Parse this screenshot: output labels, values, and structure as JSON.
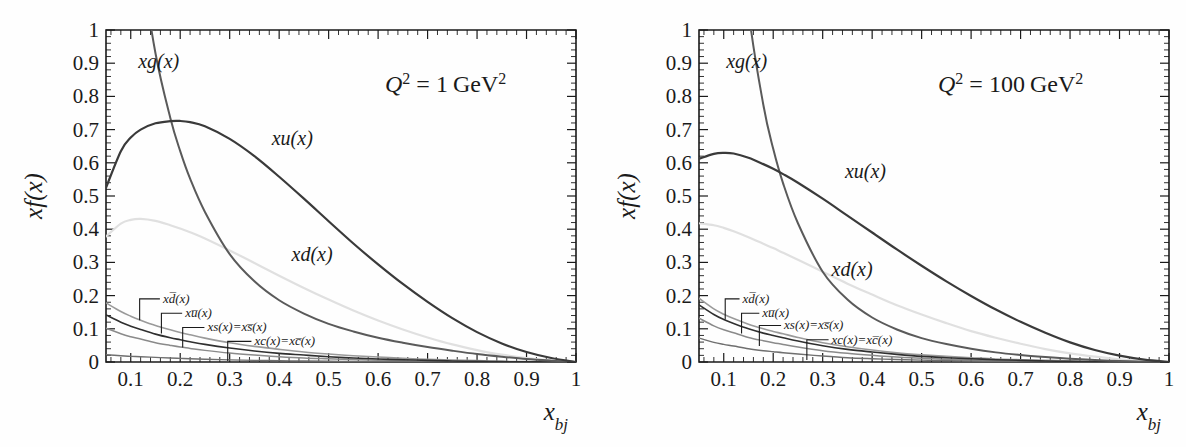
{
  "figure": {
    "type": "two-panel-line-plot",
    "background": "#ffffff"
  },
  "chart_data": [
    {
      "type": "line",
      "panel": "left",
      "title": "",
      "annotation": "Q² = 1 GeV²",
      "annotation_parts": {
        "q": "Q",
        "qexp": "2",
        "eq": "=",
        "value": "1",
        "unit": "GeV",
        "unitexp": "2"
      },
      "xlabel": "x_bj",
      "xlabel_parts": {
        "base": "x",
        "sub": "bj"
      },
      "ylabel": "xf(x)",
      "xlim": [
        0.05,
        1.0
      ],
      "ylim": [
        0.0,
        1.0
      ],
      "xticks": [
        0.1,
        0.2,
        0.3,
        0.4,
        0.5,
        0.6,
        0.7,
        0.8,
        0.9,
        1.0
      ],
      "xticklabels": [
        "0.1",
        "0.2",
        "0.3",
        "0.4",
        "0.5",
        "0.6",
        "0.7",
        "0.8",
        "0.9",
        "1"
      ],
      "yticks": [
        0,
        0.1,
        0.2,
        0.3,
        0.4,
        0.5,
        0.6,
        0.7,
        0.8,
        0.9,
        1.0
      ],
      "yticklabels": [
        "0",
        "0.1",
        "0.2",
        "0.3",
        "0.4",
        "0.5",
        "0.6",
        "0.7",
        "0.8",
        "0.9",
        "1"
      ],
      "grid": false,
      "legend": "inline-curve-labels",
      "x": [
        0.05,
        0.08,
        0.1,
        0.12,
        0.15,
        0.18,
        0.2,
        0.22,
        0.25,
        0.3,
        0.35,
        0.4,
        0.45,
        0.5,
        0.55,
        0.6,
        0.65,
        0.7,
        0.75,
        0.8,
        0.85,
        0.9,
        0.95,
        1.0
      ],
      "series": [
        {
          "name": "xg(x)",
          "label": "xg(x)",
          "color": "#5a5a5a",
          "width": 2.0,
          "values": [
            2.55,
            1.83,
            1.48,
            1.22,
            0.93,
            0.735,
            0.635,
            0.552,
            0.452,
            0.325,
            0.243,
            0.186,
            0.146,
            0.115,
            0.092,
            0.073,
            0.058,
            0.045,
            0.034,
            0.024,
            0.016,
            0.009,
            0.004,
            0.0
          ]
        },
        {
          "name": "xu(x)",
          "label": "xu(x)",
          "color": "#3a3a3a",
          "width": 2.2,
          "values": [
            0.525,
            0.635,
            0.676,
            0.7,
            0.719,
            0.7255,
            0.726,
            0.7225,
            0.71,
            0.672,
            0.62,
            0.558,
            0.492,
            0.424,
            0.357,
            0.294,
            0.235,
            0.181,
            0.132,
            0.09,
            0.056,
            0.03,
            0.012,
            0.0
          ]
        },
        {
          "name": "xd(x)",
          "label": "xd(x)",
          "color": "#e0e0e0",
          "width": 2.2,
          "values": [
            0.378,
            0.417,
            0.428,
            0.431,
            0.425,
            0.412,
            0.402,
            0.391,
            0.372,
            0.336,
            0.298,
            0.26,
            0.223,
            0.188,
            0.155,
            0.125,
            0.098,
            0.074,
            0.053,
            0.036,
            0.022,
            0.012,
            0.005,
            0.0
          ]
        },
        {
          "name": "xdbar(x)",
          "label": "xd̅(x)",
          "color": "#9a9a9a",
          "width": 1.6,
          "values": [
            0.178,
            0.152,
            0.138,
            0.126,
            0.11,
            0.097,
            0.089,
            0.082,
            0.072,
            0.058,
            0.047,
            0.038,
            0.03,
            0.024,
            0.019,
            0.015,
            0.011,
            0.008,
            0.006,
            0.004,
            0.002,
            0.001,
            0.0005,
            0.0
          ]
        },
        {
          "name": "xubar(x)",
          "label": "xu̅(x)",
          "color": "#2f2f2f",
          "width": 1.6,
          "values": [
            0.142,
            0.12,
            0.108,
            0.098,
            0.084,
            0.073,
            0.067,
            0.061,
            0.053,
            0.042,
            0.033,
            0.026,
            0.021,
            0.016,
            0.012,
            0.009,
            0.007,
            0.005,
            0.003,
            0.002,
            0.001,
            0.0005,
            0.0002,
            0.0
          ]
        },
        {
          "name": "xs(x)=xsbar(x)",
          "label": "xs(x)=xs̅(x)",
          "color": "#8a8a8a",
          "width": 1.5,
          "values": [
            0.102,
            0.085,
            0.076,
            0.069,
            0.058,
            0.05,
            0.045,
            0.041,
            0.035,
            0.027,
            0.021,
            0.016,
            0.012,
            0.0095,
            0.0072,
            0.0054,
            0.0039,
            0.0027,
            0.0018,
            0.0011,
            0.0006,
            0.0003,
            0.0001,
            0.0
          ]
        },
        {
          "name": "xc(x)=xcbar(x)",
          "label": "xc(x)=xc̅(x)",
          "color": "#6f6f6f",
          "width": 1.4,
          "values": [
            0.022,
            0.019,
            0.017,
            0.016,
            0.014,
            0.012,
            0.011,
            0.01,
            0.0085,
            0.0065,
            0.005,
            0.0038,
            0.0029,
            0.0022,
            0.0016,
            0.0012,
            0.0008,
            0.0006,
            0.0004,
            0.0002,
            0.0001,
            5e-05,
            2e-05,
            0.0
          ]
        }
      ],
      "inline_labels": [
        {
          "text": "xg(x)",
          "x": 0.115,
          "y": 0.885,
          "color": "#5a5a5a",
          "size": 20
        },
        {
          "text": "xu(x)",
          "x": 0.385,
          "y": 0.655,
          "color": "#3a3a3a",
          "size": 20
        },
        {
          "text": "xd(x)",
          "x": 0.425,
          "y": 0.305,
          "color": "#d2d2d2",
          "size": 20
        }
      ],
      "callouts": [
        {
          "text": "xd̅(x)",
          "tx": 0.165,
          "ty": 0.178,
          "lx": 0.118,
          "ly": 0.168
        },
        {
          "text": "xu̅(x)",
          "tx": 0.21,
          "ty": 0.135,
          "lx": 0.162,
          "ly": 0.128
        },
        {
          "text": "xs(x)=xs̅(x)",
          "tx": 0.255,
          "ty": 0.092,
          "lx": 0.205,
          "ly": 0.086
        },
        {
          "text": "xc(x)=xc̅(x)",
          "tx": 0.35,
          "ty": 0.05,
          "lx": 0.296,
          "ly": 0.045
        }
      ]
    },
    {
      "type": "line",
      "panel": "right",
      "title": "",
      "annotation": "Q² = 100 GeV²",
      "annotation_parts": {
        "q": "Q",
        "qexp": "2",
        "eq": "=",
        "value": "100",
        "unit": "GeV",
        "unitexp": "2"
      },
      "xlabel": "x_bj",
      "xlabel_parts": {
        "base": "x",
        "sub": "bj"
      },
      "ylabel": "xf(x)",
      "xlim": [
        0.05,
        1.0
      ],
      "ylim": [
        0.0,
        1.0
      ],
      "xticks": [
        0.1,
        0.2,
        0.3,
        0.4,
        0.5,
        0.6,
        0.7,
        0.8,
        0.9,
        1.0
      ],
      "xticklabels": [
        "0.1",
        "0.2",
        "0.3",
        "0.4",
        "0.5",
        "0.6",
        "0.7",
        "0.8",
        "0.9",
        "1"
      ],
      "yticks": [
        0,
        0.1,
        0.2,
        0.3,
        0.4,
        0.5,
        0.6,
        0.7,
        0.8,
        0.9,
        1.0
      ],
      "yticklabels": [
        "0",
        "0.1",
        "0.2",
        "0.3",
        "0.4",
        "0.5",
        "0.6",
        "0.7",
        "0.8",
        "0.9",
        "1"
      ],
      "grid": false,
      "legend": "inline-curve-labels",
      "x": [
        0.05,
        0.08,
        0.1,
        0.12,
        0.15,
        0.18,
        0.2,
        0.22,
        0.25,
        0.3,
        0.35,
        0.4,
        0.45,
        0.5,
        0.55,
        0.6,
        0.65,
        0.7,
        0.75,
        0.8,
        0.85,
        0.9,
        0.95,
        1.0
      ],
      "series": [
        {
          "name": "xg(x)",
          "label": "xg(x)",
          "color": "#5a5a5a",
          "width": 2.0,
          "values": [
            4.35,
            2.62,
            1.98,
            1.53,
            1.06,
            0.775,
            0.642,
            0.538,
            0.418,
            0.272,
            0.188,
            0.134,
            0.098,
            0.072,
            0.054,
            0.04,
            0.029,
            0.021,
            0.015,
            0.01,
            0.006,
            0.003,
            0.001,
            0.0
          ]
        },
        {
          "name": "xu(x)",
          "label": "xu(x)",
          "color": "#3a3a3a",
          "width": 2.2,
          "values": [
            0.612,
            0.627,
            0.63,
            0.628,
            0.615,
            0.596,
            0.582,
            0.566,
            0.54,
            0.492,
            0.441,
            0.39,
            0.339,
            0.29,
            0.243,
            0.199,
            0.158,
            0.121,
            0.088,
            0.059,
            0.036,
            0.019,
            0.007,
            0.0
          ]
        },
        {
          "name": "xd(x)",
          "label": "xd(x)",
          "color": "#e0e0e0",
          "width": 2.2,
          "values": [
            0.418,
            0.412,
            0.404,
            0.394,
            0.376,
            0.356,
            0.343,
            0.329,
            0.308,
            0.272,
            0.236,
            0.203,
            0.171,
            0.143,
            0.117,
            0.093,
            0.073,
            0.055,
            0.039,
            0.026,
            0.016,
            0.008,
            0.003,
            0.0
          ]
        },
        {
          "name": "xdbar(x)",
          "label": "xd̅(x)",
          "color": "#9a9a9a",
          "width": 1.6,
          "values": [
            0.192,
            0.16,
            0.144,
            0.131,
            0.114,
            0.1,
            0.092,
            0.085,
            0.074,
            0.058,
            0.046,
            0.036,
            0.028,
            0.022,
            0.017,
            0.013,
            0.009,
            0.007,
            0.005,
            0.003,
            0.0015,
            0.0007,
            0.0003,
            0.0
          ]
        },
        {
          "name": "xubar(x)",
          "label": "xu̅(x)",
          "color": "#2f2f2f",
          "width": 1.6,
          "values": [
            0.172,
            0.143,
            0.128,
            0.116,
            0.1,
            0.087,
            0.08,
            0.073,
            0.063,
            0.049,
            0.038,
            0.03,
            0.023,
            0.017,
            0.013,
            0.01,
            0.007,
            0.005,
            0.003,
            0.002,
            0.001,
            0.0004,
            0.0001,
            0.0
          ]
        },
        {
          "name": "xs(x)=xsbar(x)",
          "label": "xs(x)=xs̅(x)",
          "color": "#8a8a8a",
          "width": 1.5,
          "values": [
            0.132,
            0.109,
            0.097,
            0.088,
            0.074,
            0.064,
            0.058,
            0.053,
            0.045,
            0.034,
            0.026,
            0.02,
            0.015,
            0.011,
            0.0085,
            0.0062,
            0.0044,
            0.0031,
            0.002,
            0.0012,
            0.0006,
            0.0003,
            0.0001,
            0.0
          ]
        },
        {
          "name": "xc(x)=xcbar(x)",
          "label": "xc(x)=xc̅(x)",
          "color": "#6f6f6f",
          "width": 1.4,
          "values": [
            0.072,
            0.059,
            0.053,
            0.048,
            0.04,
            0.034,
            0.031,
            0.028,
            0.024,
            0.018,
            0.013,
            0.01,
            0.0075,
            0.0055,
            0.004,
            0.0029,
            0.002,
            0.0014,
            0.0009,
            0.0005,
            0.0003,
            0.0001,
            5e-05,
            0.0
          ]
        }
      ],
      "inline_labels": [
        {
          "text": "xg(x)",
          "x": 0.105,
          "y": 0.885,
          "color": "#5a5a5a",
          "size": 20
        },
        {
          "text": "xu(x)",
          "x": 0.345,
          "y": 0.555,
          "color": "#3a3a3a",
          "size": 20
        },
        {
          "text": "xd(x)",
          "x": 0.318,
          "y": 0.258,
          "color": "#d2d2d2",
          "size": 20
        }
      ],
      "callouts": [
        {
          "text": "xd̅(x)",
          "tx": 0.138,
          "ty": 0.178,
          "lx": 0.103,
          "ly": 0.17
        },
        {
          "text": "xu̅(x)",
          "tx": 0.178,
          "ty": 0.135,
          "lx": 0.136,
          "ly": 0.128
        },
        {
          "text": "xs(x)=xs̅(x)",
          "tx": 0.222,
          "ty": 0.098,
          "lx": 0.172,
          "ly": 0.09
        },
        {
          "text": "xc(x)=xc̅(x)",
          "tx": 0.318,
          "ty": 0.055,
          "lx": 0.268,
          "ly": 0.048
        }
      ]
    }
  ]
}
